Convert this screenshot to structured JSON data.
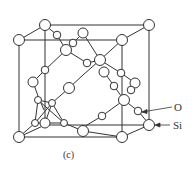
{
  "figure": {
    "caption": "(c)",
    "labels": {
      "oxygen": "O",
      "silicon": "Si"
    },
    "colors": {
      "stroke": "#333333",
      "background": "#ffffff",
      "atom_fill": "#ffffff"
    }
  }
}
